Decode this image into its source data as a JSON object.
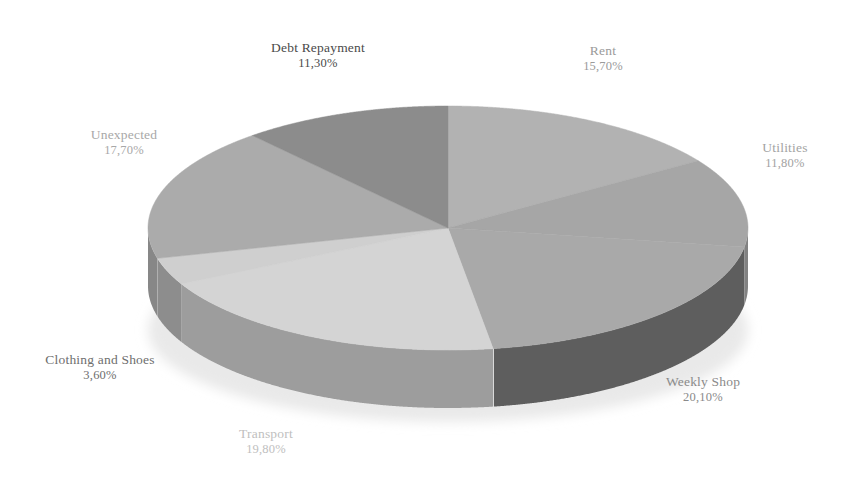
{
  "chart_data": {
    "type": "pie",
    "title": "",
    "subtitle": "",
    "xlabel": "",
    "ylabel": "",
    "legend_position": "none",
    "grid": false,
    "three_d": true,
    "decimal_separator": ",",
    "value_suffix": "%",
    "categories": [
      "Rent",
      "Utilities",
      "Weekly Shop",
      "Transport",
      "Clothing and Shoes",
      "Unexpected",
      "Debt Repayment"
    ],
    "values": [
      15.7,
      11.8,
      20.1,
      19.8,
      3.6,
      17.7,
      11.3
    ],
    "labels": [
      "15,70%",
      "11,80%",
      "20,10%",
      "19,80%",
      "3,60%",
      "17,70%",
      "11,30%"
    ],
    "slices": [
      {
        "name": "Rent",
        "value": 15.7,
        "label": "15,70%",
        "top_color": "#b2b2b2",
        "side_color": "#8f8f8f",
        "label_color": "#9a9a9a"
      },
      {
        "name": "Utilities",
        "value": 11.8,
        "label": "11,80%",
        "top_color": "#a6a6a6",
        "side_color": "#828282",
        "label_color": "#a3a3a3"
      },
      {
        "name": "Weekly Shop",
        "value": 20.1,
        "label": "20,10%",
        "top_color": "#a9a9a9",
        "side_color": "#5e5e5e",
        "label_color": "#8a8a8a"
      },
      {
        "name": "Transport",
        "value": 19.8,
        "label": "19,80%",
        "top_color": "#d4d4d4",
        "side_color": "#9d9d9d",
        "label_color": "#c0c0c0"
      },
      {
        "name": "Clothing and Shoes",
        "value": 3.6,
        "label": "3,60%",
        "top_color": "#cfcfcf",
        "side_color": "#8d8d8d",
        "label_color": "#6e6e6e"
      },
      {
        "name": "Unexpected",
        "value": 17.7,
        "label": "17,70%",
        "top_color": "#ababab",
        "side_color": "#878787",
        "label_color": "#a8a8a8"
      },
      {
        "name": "Debt Repayment",
        "value": 11.3,
        "label": "11,30%",
        "top_color": "#8c8c8c",
        "side_color": "#6f6f6f",
        "label_color": "#4a4a4a"
      }
    ]
  },
  "labels": {
    "debt": {
      "name": "Debt Repayment",
      "value": "11,30%"
    },
    "rent": {
      "name": "Rent",
      "value": "15,70%"
    },
    "utilities": {
      "name": "Utilities",
      "value": "11,80%"
    },
    "weekly": {
      "name": "Weekly Shop",
      "value": "20,10%"
    },
    "transport": {
      "name": "Transport",
      "value": "19,80%"
    },
    "clothing": {
      "name": "Clothing and Shoes",
      "value": "3,60%"
    },
    "unexpected": {
      "name": "Unexpected",
      "value": "17,70%"
    }
  },
  "colors": {
    "background": "#ffffff",
    "rent": "#b2b2b2",
    "utilities": "#a6a6a6",
    "weekly_shop": "#a9a9a9",
    "transport": "#d4d4d4",
    "clothing_and_shoes": "#cfcfcf",
    "unexpected": "#ababab",
    "debt_repayment": "#8c8c8c"
  }
}
